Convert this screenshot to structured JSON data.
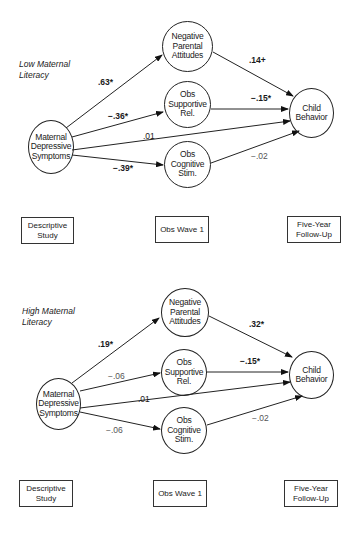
{
  "figure": {
    "panels": [
      {
        "title": "Low Maternal\nLiteracy",
        "nodes": {
          "maternal": "Maternal\nDepressive\nSymptoms",
          "negative": "Negative\nParental\nAttitudes",
          "supportive": "Obs\nSupportive\nRel.",
          "cognitive": "Obs\nCognitive\nStim.",
          "child": "Child\nBehavior"
        },
        "paths": {
          "maternal_negative": ".63*",
          "maternal_supportive": "−.36*",
          "maternal_child": ".01",
          "maternal_cognitive": "−.39*",
          "negative_child": ".14+",
          "supportive_child": "−.15*",
          "cognitive_child": "−.02"
        },
        "timeline": {
          "descriptive": "Descriptive\nStudy",
          "wave1": "Obs Wave 1",
          "followup": "Five-Year\nFollow-Up"
        }
      },
      {
        "title": "High Maternal\nLiteracy",
        "nodes": {
          "maternal": "Maternal\nDepressive\nSymptoms",
          "negative": "Negative\nParental\nAttitudes",
          "supportive": "Obs\nSupportive\nRel.",
          "cognitive": "Obs\nCognitive\nStim.",
          "child": "Child\nBehavior"
        },
        "paths": {
          "maternal_negative": ".19*",
          "maternal_supportive": "−.06",
          "maternal_child": ".01",
          "maternal_cognitive": "−.06",
          "negative_child": ".32*",
          "supportive_child": "−.15*",
          "cognitive_child": "−.02"
        },
        "timeline": {
          "descriptive": "Descriptive\nStudy",
          "wave1": "Obs Wave 1",
          "followup": "Five-Year\nFollow-Up"
        }
      }
    ]
  }
}
